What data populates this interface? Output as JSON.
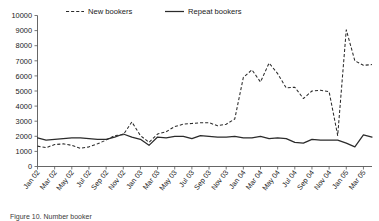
{
  "chart_data": {
    "type": "line",
    "title": "",
    "xlabel": "",
    "ylabel": "",
    "ylim": [
      0,
      10000
    ],
    "ytick_step": 1000,
    "yticks": [
      "0",
      "1000",
      "2000",
      "3000",
      "4000",
      "5000",
      "6000",
      "7000",
      "8000",
      "9000",
      "10000"
    ],
    "grid": false,
    "legend_position": "top-center",
    "x_tick_labels": [
      "Jan 02",
      "Mar 02",
      "May 02",
      "Jul 02",
      "Sep 02",
      "Nov 02",
      "Jan 03",
      "Mar 03",
      "May 03",
      "Jul 03",
      "Sep 03",
      "Nov 03",
      "Jan 04",
      "Mar 04",
      "May 04",
      "Jul 04",
      "Sep 04",
      "Nov 04",
      "Jan 05",
      "Mar 05"
    ],
    "x": [
      "Jan 02",
      "Feb 02",
      "Mar 02",
      "Apr 02",
      "May 02",
      "Jun 02",
      "Jul 02",
      "Aug 02",
      "Sep 02",
      "Oct 02",
      "Nov 02",
      "Dec 02",
      "Jan 03",
      "Feb 03",
      "Mar 03",
      "Apr 03",
      "May 03",
      "Jun 03",
      "Jul 03",
      "Aug 03",
      "Sep 03",
      "Oct 03",
      "Nov 03",
      "Dec 03",
      "Jan 04",
      "Feb 04",
      "Mar 04",
      "Apr 04",
      "May 04",
      "Jun 04",
      "Jul 04",
      "Aug 04",
      "Sep 04",
      "Oct 04",
      "Nov 04",
      "Dec 04",
      "Jan 05",
      "Feb 05",
      "Mar 05",
      "Apr 05"
    ],
    "series": [
      {
        "name": "New bookers",
        "style": "dashed",
        "values": [
          1350,
          1250,
          1450,
          1500,
          1400,
          1200,
          1300,
          1500,
          1750,
          2050,
          2100,
          2950,
          2050,
          1600,
          2150,
          2300,
          2650,
          2800,
          2850,
          2900,
          2900,
          2700,
          2800,
          3150,
          5900,
          6400,
          5600,
          6850,
          6150,
          5200,
          5250,
          4500,
          5000,
          5050,
          4950,
          2050,
          9050,
          7000,
          6700,
          6750
        ]
      },
      {
        "name": "Repeat bookers",
        "style": "solid",
        "values": [
          1900,
          1750,
          1800,
          1850,
          1900,
          1900,
          1850,
          1800,
          1800,
          1950,
          2150,
          1950,
          1800,
          1400,
          1950,
          1900,
          2000,
          2000,
          1850,
          2050,
          2000,
          1950,
          1950,
          2000,
          1900,
          1900,
          2000,
          1850,
          1900,
          1850,
          1600,
          1550,
          1800,
          1750,
          1750,
          1750,
          1550,
          1300,
          2100,
          1950
        ]
      }
    ]
  },
  "legend": {
    "entries": [
      {
        "label": "New bookers",
        "marker": "dashed-line-icon"
      },
      {
        "label": "Repeat bookers",
        "marker": "solid-line-icon"
      }
    ]
  },
  "caption": {
    "text": "Figure 10. Number booker"
  }
}
